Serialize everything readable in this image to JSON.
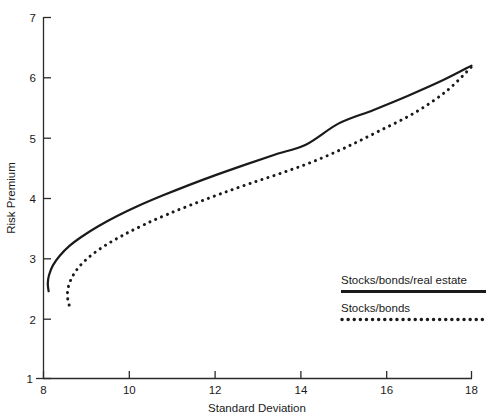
{
  "chart_data": {
    "type": "line",
    "title": "",
    "xlabel": "Standard Deviation",
    "ylabel": "Risk Premium",
    "xlim": [
      8,
      18
    ],
    "ylim": [
      1,
      7
    ],
    "xticks": [
      "8",
      "10",
      "12",
      "14",
      "16",
      "18"
    ],
    "xtick_values": [
      8,
      10,
      12,
      14,
      16,
      18
    ],
    "yticks": [
      "1",
      "2",
      "3",
      "4",
      "5",
      "6",
      "7"
    ],
    "ytick_values": [
      1,
      2,
      3,
      4,
      5,
      6,
      7
    ],
    "grid": false,
    "legend_position": "lower-right",
    "series": [
      {
        "name": "Stocks/bonds/real estate",
        "style": "solid",
        "color": "#1a1a1a",
        "x": [
          8.12,
          8.1,
          8.13,
          8.22,
          8.38,
          8.6,
          8.9,
          9.28,
          9.72,
          10.22,
          10.78,
          11.38,
          12.02,
          12.7,
          13.4,
          14.14,
          14.9,
          15.7,
          16.52,
          17.34,
          18.0
        ],
        "y": [
          2.45,
          2.58,
          2.72,
          2.88,
          3.04,
          3.2,
          3.36,
          3.53,
          3.7,
          3.87,
          4.04,
          4.21,
          4.38,
          4.55,
          4.72,
          4.89,
          5.24,
          5.46,
          5.7,
          5.96,
          6.2
        ]
      },
      {
        "name": "Stocks/bonds",
        "style": "dotted",
        "color": "#1a1a1a",
        "x": [
          8.6,
          8.56,
          8.58,
          8.68,
          8.86,
          9.12,
          9.46,
          9.88,
          10.36,
          10.9,
          11.5,
          12.14,
          12.82,
          13.54,
          14.28,
          15.06,
          15.86,
          16.68,
          17.42,
          18.0
        ],
        "y": [
          2.22,
          2.36,
          2.52,
          2.7,
          2.88,
          3.05,
          3.22,
          3.39,
          3.56,
          3.73,
          3.9,
          4.07,
          4.24,
          4.41,
          4.6,
          4.84,
          5.12,
          5.42,
          5.78,
          6.18
        ]
      }
    ]
  },
  "axes": {
    "y_axis_title": "Risk Premium",
    "x_axis_title": "Standard Deviation",
    "y_tick_labels": [
      "7",
      "6",
      "5",
      "4",
      "3",
      "2",
      "1"
    ],
    "x_tick_labels": [
      "8",
      "10",
      "12",
      "14",
      "16",
      "18"
    ]
  },
  "legend": {
    "entries": [
      {
        "label": "Stocks/bonds/real estate",
        "style": "solid"
      },
      {
        "label": "Stocks/bonds",
        "style": "dotted"
      }
    ]
  },
  "top_caption": {
    "text": ""
  }
}
